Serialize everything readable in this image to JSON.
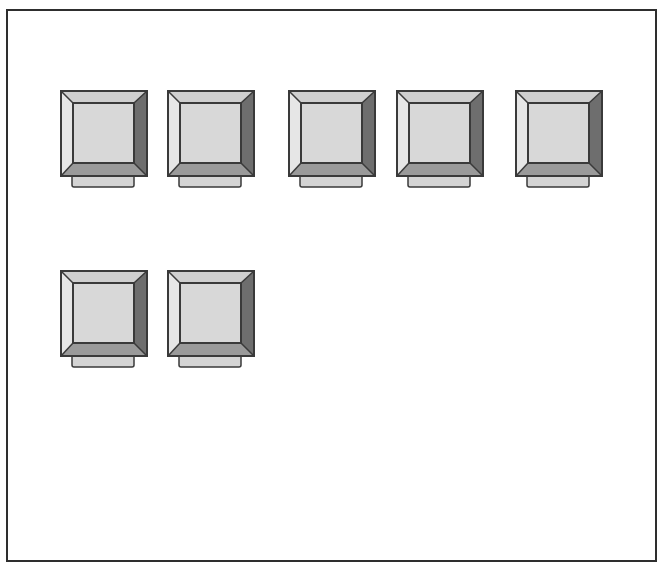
{
  "window": {
    "frame_border_color": "#2e2e2e",
    "background": "#ffffff"
  },
  "icon": {
    "semantic": "monitor-icon",
    "colors": {
      "outline": "#3a3a3a",
      "face": "#d8d8d8",
      "bevel_top": "#cfcfcf",
      "bevel_left": "#e6e6e6",
      "bevel_right": "#6e6e6e",
      "bevel_bottom": "#9a9a9a",
      "stand": "#d4d4d4"
    }
  },
  "tiles": [
    {
      "row": 1,
      "col": 1,
      "x": 60,
      "y": 90
    },
    {
      "row": 1,
      "col": 2,
      "x": 167,
      "y": 90
    },
    {
      "row": 1,
      "col": 3,
      "x": 288,
      "y": 90
    },
    {
      "row": 1,
      "col": 4,
      "x": 396,
      "y": 90
    },
    {
      "row": 1,
      "col": 5,
      "x": 515,
      "y": 90
    },
    {
      "row": 2,
      "col": 1,
      "x": 60,
      "y": 270
    },
    {
      "row": 2,
      "col": 2,
      "x": 167,
      "y": 270
    }
  ]
}
